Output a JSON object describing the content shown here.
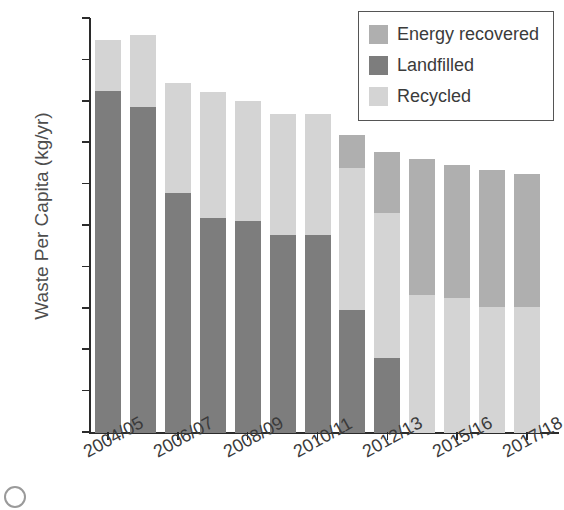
{
  "chart_data": {
    "type": "bar",
    "subtype": "stacked-bar",
    "title": "",
    "xlabel": "",
    "ylabel": "Waste Per Capita (kg/yr)",
    "ylim": [
      0,
      500
    ],
    "ytick_step": 50,
    "yticks": [
      500,
      450,
      400,
      350,
      300,
      250,
      200,
      150,
      100,
      50,
      0
    ],
    "grid": false,
    "legend_position": "top-right",
    "categories": [
      "2004/05",
      "2005/06",
      "2006/07",
      "2007/08",
      "2008/09",
      "2009/10",
      "2010/11",
      "2011/12",
      "2012/13",
      "2013/14",
      "2015/16",
      "2016/17",
      "2017/18"
    ],
    "visible_tick_labels": [
      "2004/05",
      "2006/07",
      "2008/09",
      "2010/11",
      "2012/13",
      "2015/16",
      "2017/18"
    ],
    "visible_tick_indices": [
      0,
      2,
      4,
      6,
      8,
      10,
      12
    ],
    "series": [
      {
        "name": "Landfilled",
        "color": "#7d7d7d",
        "values": [
          413,
          394,
          290,
          260,
          256,
          239,
          239,
          149,
          90,
          0,
          0,
          0,
          0
        ]
      },
      {
        "name": "Recycled",
        "color": "#d4d4d4",
        "values": [
          62,
          87,
          133,
          152,
          145,
          146,
          146,
          171,
          176,
          167,
          163,
          152,
          152
        ]
      },
      {
        "name": "Energy recovered",
        "color": "#afafaf",
        "values": [
          0,
          0,
          0,
          0,
          0,
          0,
          0,
          40,
          74,
          164,
          161,
          166,
          161
        ]
      }
    ],
    "stack_order_bottom_to_top": [
      "Landfilled",
      "Recycled",
      "Energy recovered"
    ],
    "totals": [
      475,
      481,
      423,
      412,
      401,
      385,
      385,
      360,
      340,
      331,
      324,
      318,
      313
    ]
  },
  "legend": {
    "items": [
      {
        "label": "Energy recovered",
        "color": "#afafaf"
      },
      {
        "label": "Landfilled",
        "color": "#7d7d7d"
      },
      {
        "label": "Recycled",
        "color": "#d4d4d4"
      }
    ]
  },
  "colors": {
    "axis": "#2b2b2b",
    "tick_text": "#4d4d4d",
    "background": "#ffffff"
  }
}
